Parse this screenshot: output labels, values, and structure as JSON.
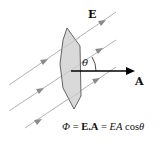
{
  "diagram": {
    "field_label": "E",
    "area_vector_label": "A",
    "angle_label": "θ",
    "equation": {
      "phi": "Φ",
      "eq1": " = ",
      "dot_product": "E.A",
      "eq2": " = ",
      "ea": "EA",
      "cos": " cos",
      "theta": "θ"
    },
    "colors": {
      "field_lines": "#a0a0a0",
      "surface_fill": "#d9d9d9",
      "surface_stroke": "#555555",
      "vector": "#000000"
    }
  }
}
